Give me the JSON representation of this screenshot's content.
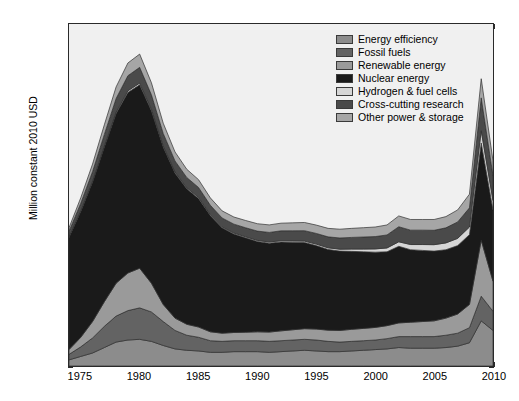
{
  "chart_data": {
    "type": "area",
    "title": "",
    "subtitle": "",
    "xlabel": "",
    "ylabel": "Million constant 2010 USD",
    "xlim": [
      1974,
      2010
    ],
    "ylim": [
      0,
      25000
    ],
    "ytick_labels": [
      "0",
      "5,000",
      "10,000",
      "15,000",
      "20,000",
      "25,000"
    ],
    "ytick_values": [
      0,
      5000,
      10000,
      15000,
      20000,
      25000
    ],
    "xtick_labels": [
      "1975",
      "1980",
      "1985",
      "1990",
      "1995",
      "2000",
      "2005",
      "2010"
    ],
    "xtick_values": [
      1975,
      1980,
      1985,
      1990,
      1995,
      2000,
      2005,
      2010
    ],
    "grid": false,
    "stacked": true,
    "legend_position": "top-right",
    "x": [
      1974,
      1975,
      1976,
      1977,
      1978,
      1979,
      1980,
      1981,
      1982,
      1983,
      1984,
      1985,
      1986,
      1987,
      1988,
      1989,
      1990,
      1991,
      1992,
      1993,
      1994,
      1995,
      1996,
      1997,
      1998,
      1999,
      2000,
      2001,
      2002,
      2003,
      2004,
      2005,
      2006,
      2007,
      2008,
      2009,
      2010
    ],
    "series": [
      {
        "name": "Energy efficiency",
        "color": "#8c8c8c",
        "values": [
          450,
          700,
          950,
          1350,
          1750,
          1900,
          1950,
          1800,
          1500,
          1250,
          1150,
          1100,
          1000,
          1000,
          1050,
          1050,
          1050,
          1000,
          1050,
          1100,
          1150,
          1100,
          1050,
          1050,
          1100,
          1150,
          1200,
          1250,
          1350,
          1300,
          1300,
          1300,
          1350,
          1450,
          1700,
          3300,
          2600
        ]
      },
      {
        "name": "Fossil fuels",
        "color": "#636363",
        "values": [
          400,
          700,
          1100,
          1550,
          1900,
          2150,
          2300,
          2150,
          1750,
          1350,
          1100,
          1000,
          850,
          800,
          800,
          800,
          800,
          800,
          800,
          800,
          800,
          800,
          750,
          700,
          700,
          700,
          700,
          750,
          800,
          850,
          850,
          850,
          900,
          950,
          1100,
          1800,
          1400
        ]
      },
      {
        "name": "Renewable energy",
        "color": "#9a9a9a",
        "values": [
          350,
          700,
          1200,
          1800,
          2400,
          2750,
          2900,
          2100,
          1250,
          900,
          800,
          750,
          650,
          600,
          600,
          620,
          650,
          680,
          720,
          750,
          780,
          800,
          820,
          850,
          880,
          900,
          920,
          950,
          1000,
          1050,
          1100,
          1150,
          1250,
          1400,
          1700,
          4100,
          2200
        ]
      },
      {
        "name": "Nuclear energy",
        "color": "#1a1a1a",
        "values": [
          8200,
          9200,
          10200,
          11300,
          12400,
          13200,
          13400,
          12600,
          11500,
          10600,
          9900,
          9400,
          8500,
          7700,
          7200,
          6900,
          6600,
          6500,
          6500,
          6400,
          6300,
          6100,
          5900,
          5800,
          5700,
          5600,
          5500,
          5400,
          5600,
          5300,
          5200,
          5100,
          5000,
          5000,
          5100,
          7100,
          5200
        ]
      },
      {
        "name": "Hydrogen & fuel cells",
        "color": "#d6d6d6",
        "values": [
          40,
          50,
          60,
          80,
          100,
          120,
          130,
          120,
          100,
          90,
          80,
          80,
          70,
          70,
          70,
          75,
          80,
          85,
          90,
          95,
          100,
          110,
          120,
          140,
          170,
          200,
          240,
          280,
          330,
          380,
          430,
          470,
          500,
          530,
          560,
          900,
          700
        ]
      },
      {
        "name": "Cross-cutting research",
        "color": "#4a4a4a",
        "values": [
          400,
          550,
          700,
          850,
          1000,
          1100,
          1150,
          1050,
          900,
          800,
          750,
          720,
          680,
          650,
          650,
          660,
          680,
          700,
          720,
          740,
          760,
          780,
          800,
          820,
          850,
          880,
          900,
          950,
          1100,
          1050,
          1050,
          1050,
          1100,
          1200,
          1400,
          2400,
          1800
        ]
      },
      {
        "name": "Other power & storage",
        "color": "#a6a6a6",
        "values": [
          260,
          400,
          550,
          700,
          850,
          930,
          970,
          880,
          750,
          660,
          600,
          570,
          540,
          520,
          520,
          530,
          540,
          550,
          560,
          580,
          600,
          610,
          620,
          640,
          660,
          680,
          700,
          730,
          790,
          780,
          780,
          790,
          820,
          880,
          1000,
          1400,
          1100
        ]
      }
    ],
    "totals": [
      10100,
      12300,
      14760,
      17630,
      20400,
      22150,
      22800,
      20700,
      17750,
      15650,
      14380,
      13620,
      12290,
      11340,
      10890,
      10635,
      10400,
      10315,
      10440,
      10465,
      10490,
      10300,
      10060,
      10000,
      10060,
      10110,
      10160,
      10310,
      10970,
      10710,
      10710,
      10710,
      10920,
      11410,
      12560,
      21000,
      15000
    ]
  },
  "legend": {
    "items": [
      {
        "label": "Energy efficiency",
        "color": "#8c8c8c"
      },
      {
        "label": "Fossil fuels",
        "color": "#636363"
      },
      {
        "label": "Renewable energy",
        "color": "#9a9a9a"
      },
      {
        "label": "Nuclear energy",
        "color": "#1a1a1a"
      },
      {
        "label": "Hydrogen & fuel cells",
        "color": "#d6d6d6"
      },
      {
        "label": "Cross-cutting research",
        "color": "#4a4a4a"
      },
      {
        "label": "Other power & storage",
        "color": "#a6a6a6"
      }
    ]
  },
  "theme": {
    "plot_background": "#f0f0f0",
    "figure_background": "#ffffff",
    "axis_color": "#2a2a2a",
    "text_color": "#000000"
  }
}
